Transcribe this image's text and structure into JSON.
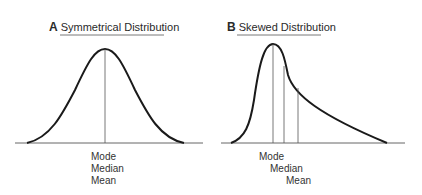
{
  "panels": [
    {
      "letter": "A",
      "title": "Symmetrical Distribution",
      "labels": [
        "Mode",
        "Median",
        "Mean"
      ]
    },
    {
      "letter": "B",
      "title": "Skewed Distribution",
      "labels": [
        "Mode",
        "Median",
        "Mean"
      ]
    }
  ],
  "colors": {
    "curve": "#1a1a1a",
    "line": "#555555",
    "axis": "#666666"
  }
}
